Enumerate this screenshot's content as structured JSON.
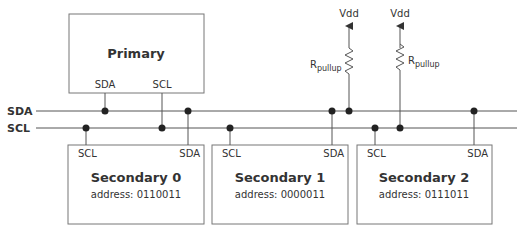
{
  "bus": {
    "sda_label": "SDA",
    "scl_label": "SCL"
  },
  "primary": {
    "title": "Primary",
    "pin_sda": "SDA",
    "pin_scl": "SCL"
  },
  "secondaries": [
    {
      "title": "Secondary 0",
      "address": "address: 0110011",
      "pin_scl": "SCL",
      "pin_sda": "SDA"
    },
    {
      "title": "Secondary 1",
      "address": "address: 0000011",
      "pin_scl": "SCL",
      "pin_sda": "SDA"
    },
    {
      "title": "Secondary 2",
      "address": "address: 0111011",
      "pin_scl": "SCL",
      "pin_sda": "SDA"
    }
  ],
  "pullups": [
    {
      "supply": "Vdd",
      "label": "R",
      "subscript": "pullup",
      "line": "SDA"
    },
    {
      "supply": "Vdd",
      "label": "R",
      "subscript": "pullup",
      "line": "SCL"
    }
  ],
  "colors": {
    "line": "#555555",
    "dot": "#222222",
    "box": "#777777",
    "text": "#333333"
  }
}
